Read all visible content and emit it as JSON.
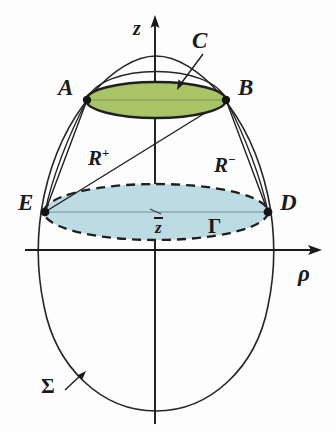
{
  "figure": {
    "background_color": "#fdfdfd",
    "width": 336,
    "height": 433
  },
  "axes": {
    "vertical": {
      "label": "z",
      "name": "z-axis",
      "x": 155,
      "y_top": 18,
      "y_bottom": 424
    },
    "horizontal": {
      "label": "ρ",
      "name": "rho-axis",
      "y": 250,
      "x_left": 25,
      "x_right": 322
    }
  },
  "labels": {
    "A": "A",
    "B": "B",
    "C": "C",
    "D": "D",
    "E": "E",
    "R_plus_base": "R",
    "R_plus_sup": "+",
    "R_minus_base": "R",
    "R_minus_sup": "−",
    "z_bar": "z",
    "Gamma": "Γ",
    "Sigma": "Σ"
  },
  "regions": {
    "upper_disk": {
      "name": "green-ellipse",
      "fill": "#a9c466",
      "stroke": "#1f1f1f",
      "cx": 156,
      "cy": 100,
      "rx": 70,
      "ry": 18,
      "label": "C"
    },
    "lower_disk": {
      "name": "blue-ellipse",
      "fill": "#bcdbe3",
      "stroke": "#1f1f1f",
      "stroke_dash": "9,6",
      "cx": 156,
      "cy": 212,
      "rx": 112,
      "ry": 28,
      "label": "Γ"
    }
  },
  "points": [
    {
      "name": "point-A",
      "label": "A",
      "x": 87,
      "y": 100
    },
    {
      "name": "point-B",
      "label": "B",
      "x": 226,
      "y": 100
    },
    {
      "name": "point-E",
      "label": "E",
      "x": 45,
      "y": 212
    },
    {
      "name": "point-D",
      "label": "D",
      "x": 268,
      "y": 212
    }
  ],
  "chords": [
    {
      "name": "chord-A-E",
      "from": "A",
      "to": "E"
    },
    {
      "name": "chord-B-D",
      "from": "B",
      "to": "D"
    },
    {
      "name": "chord-E-B",
      "from": "E",
      "to": "B",
      "labels": [
        "R+",
        "R-"
      ]
    }
  ],
  "outer_curve": {
    "name": "sigma-boundary",
    "label": "Σ",
    "stroke": "#262626",
    "description": "egg-shaped meridian profile"
  },
  "colors": {
    "ink": "#1a1a1a",
    "curve": "#262626",
    "green_fill": "#a9c466",
    "blue_fill": "#bcdbe3",
    "background": "#fdfdfd"
  }
}
